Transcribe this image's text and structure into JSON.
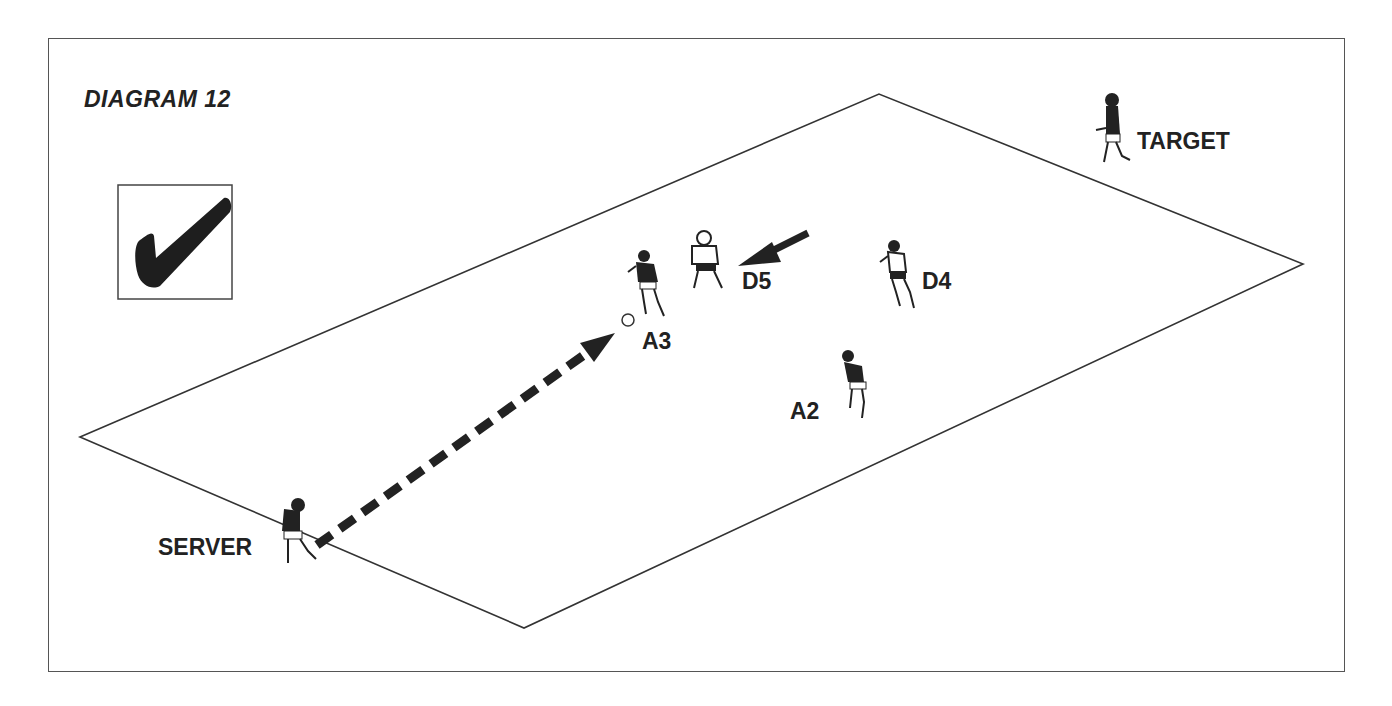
{
  "diagram": {
    "title": "DIAGRAM 12",
    "status_icon": "checkmark-icon",
    "players": [
      {
        "id": "server",
        "label": "SERVER",
        "shirt": "dark"
      },
      {
        "id": "a3",
        "label": "A3",
        "shirt": "dark"
      },
      {
        "id": "d5",
        "label": "D5",
        "shirt": "light"
      },
      {
        "id": "d4",
        "label": "D4",
        "shirt": "light"
      },
      {
        "id": "a2",
        "label": "A2",
        "shirt": "dark"
      },
      {
        "id": "target",
        "label": "TARGET",
        "shirt": "dark"
      }
    ],
    "annotations": {
      "pass": "dashed arrow from SERVER to ball near A3",
      "movement": "solid arrow toward D5"
    },
    "colors": {
      "ink": "#222222",
      "background": "#ffffff"
    }
  }
}
